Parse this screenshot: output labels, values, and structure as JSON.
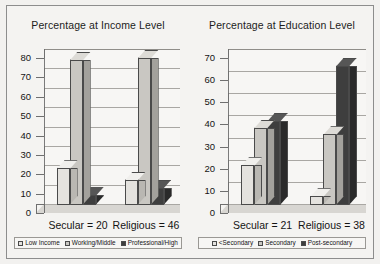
{
  "chart_data": [
    {
      "type": "bar",
      "title": "Percentage at Income Level",
      "xlabel": "",
      "ylabel": "",
      "ylim": [
        0,
        80
      ],
      "yticks": [
        0,
        10,
        20,
        30,
        40,
        50,
        60,
        70,
        80
      ],
      "grid": true,
      "legend_position": "bottom",
      "categories": [
        "Secular = 20",
        "Religious = 46"
      ],
      "series": [
        {
          "name": "Low Income",
          "values": [
            19,
            13
          ],
          "color": "#e4e2de"
        },
        {
          "name": "Working/Middle",
          "values": [
            75,
            76
          ],
          "color": "#c9c7c2"
        },
        {
          "name": "Professional/High",
          "values": [
            5,
            9
          ],
          "color": "#3e3e3e"
        }
      ]
    },
    {
      "type": "bar",
      "title": "Percentage at Education Level",
      "xlabel": "",
      "ylabel": "",
      "ylim": [
        0,
        70
      ],
      "yticks": [
        0,
        10,
        20,
        30,
        40,
        50,
        60,
        70
      ],
      "grid": true,
      "legend_position": "bottom",
      "categories": [
        "Secular = 21",
        "Religious = 38"
      ],
      "series": [
        {
          "name": "<Secondary",
          "values": [
            18,
            4
          ],
          "color": "#e4e2de"
        },
        {
          "name": "Secondary",
          "values": [
            35,
            32
          ],
          "color": "#c9c7c2"
        },
        {
          "name": "Post-secondary",
          "values": [
            38,
            63
          ],
          "color": "#3e3e3e"
        }
      ]
    }
  ],
  "colors": {
    "background": "#f2f1ef",
    "plot_background": "#f7f6f4",
    "frame": "#8d8d8d",
    "axis": "#6f6f6f",
    "gridline": "#a9a7a3",
    "text": "#141414",
    "series_1": "#e4e2de",
    "series_2": "#c9c7c2",
    "series_3": "#3e3e3e"
  }
}
